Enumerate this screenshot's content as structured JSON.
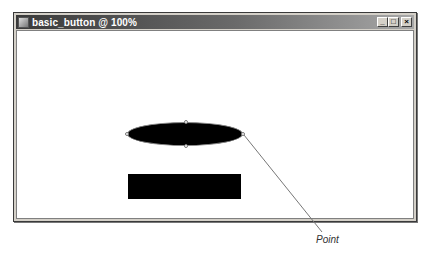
{
  "window": {
    "title": "basic_button @ 100%",
    "controls": {
      "minimize": "_",
      "maximize": "□",
      "close": "×"
    }
  },
  "canvas": {
    "shapes": [
      {
        "type": "ellipse",
        "fill": "#000000",
        "selected": true
      },
      {
        "type": "rectangle",
        "fill": "#000000"
      }
    ]
  },
  "callout": {
    "label": "Point"
  }
}
